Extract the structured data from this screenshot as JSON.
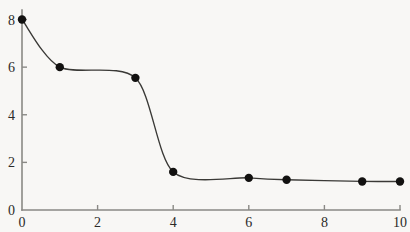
{
  "chart_data": {
    "type": "line",
    "title": "",
    "subtitle": "",
    "xlabel": "",
    "ylabel": "",
    "x": [
      0,
      1,
      3,
      4,
      6,
      7,
      9,
      10
    ],
    "values": [
      8.0,
      6.0,
      5.55,
      1.6,
      1.35,
      1.27,
      1.2,
      1.2
    ],
    "series": [
      {
        "name": "",
        "x": [
          0,
          1,
          3,
          4,
          6,
          7,
          9,
          10
        ],
        "values": [
          8.0,
          6.0,
          5.55,
          1.6,
          1.35,
          1.27,
          1.2,
          1.2
        ]
      }
    ],
    "xlim": [
      0,
      10
    ],
    "ylim": [
      0,
      8.4
    ],
    "xticks": [
      0,
      2,
      4,
      6,
      8,
      10
    ],
    "yticks": [
      0,
      2,
      4,
      6,
      8
    ],
    "xtick_labels": [
      "0",
      "2",
      "4",
      "6",
      "8",
      "10"
    ],
    "ytick_labels": [
      "0",
      "2",
      "4",
      "6",
      "8"
    ],
    "grid": false,
    "legend": false,
    "legend_position": "none",
    "smoothed": true,
    "marker": "filled-circle",
    "marker_size": 4.2,
    "colors": {
      "background": "#f8f7f5",
      "axis": "#8a8985",
      "line": "#3a3936",
      "marker": "#121110",
      "tick_label": "#2b2a28"
    },
    "geometry": {
      "origin_px": [
        22,
        210
      ],
      "x_axis_end_px": [
        400,
        210
      ],
      "y_axis_top_px": [
        22,
        10
      ],
      "px_per_x_unit": 37.6,
      "px_per_y_unit": 24.5
    }
  }
}
